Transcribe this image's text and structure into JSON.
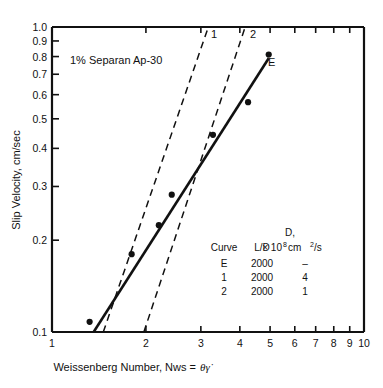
{
  "figure": {
    "background": "#ffffff",
    "ink": "#111111",
    "annotation": "1% Separan Ap-30"
  },
  "chart_data": {
    "type": "scatter",
    "title": "1% Separan Ap-30",
    "xlabel": "Weissenberg Number, Nws = θγ̇",
    "xlabel_plain": "Weissenberg Number, Nws =",
    "xlabel_symbol": "θγ̇",
    "ylabel": "Slip Velocity, cm/sec",
    "xscale": "log",
    "yscale": "log",
    "xlim": [
      1,
      10
    ],
    "ylim": [
      0.1,
      1.0
    ],
    "grid": false,
    "xticks": [
      1,
      2,
      3,
      4,
      5,
      6,
      7,
      8,
      9,
      10
    ],
    "xtick_labels": [
      "1",
      "2",
      "3",
      "4",
      "5",
      "6",
      "7",
      "8",
      "9",
      "10"
    ],
    "yticks": [
      0.1,
      0.2,
      0.3,
      0.4,
      0.5,
      0.6,
      0.7,
      0.8,
      0.9,
      1.0
    ],
    "ytick_labels": [
      "0.1",
      "0.2",
      "0.3",
      "0.4",
      "0.5",
      "0.6",
      "0.7",
      "0.8",
      "0.9",
      "1.0"
    ],
    "series": [
      {
        "name": "E",
        "label": "E",
        "style": "solid",
        "marker": "filled-circle",
        "points": [
          {
            "x": 1.32,
            "y": 0.108
          },
          {
            "x": 1.8,
            "y": 0.18
          },
          {
            "x": 2.2,
            "y": 0.224
          },
          {
            "x": 2.42,
            "y": 0.282
          },
          {
            "x": 3.28,
            "y": 0.443
          },
          {
            "x": 4.25,
            "y": 0.567
          },
          {
            "x": 4.95,
            "y": 0.812
          }
        ],
        "fit_line": [
          {
            "x": 1.36,
            "y": 0.1
          },
          {
            "x": 4.95,
            "y": 0.79
          }
        ]
      },
      {
        "name": "1",
        "label": "1",
        "style": "dashed",
        "line": [
          {
            "x": 1.46,
            "y": 0.1
          },
          {
            "x": 3.17,
            "y": 1.0
          }
        ]
      },
      {
        "name": "2",
        "label": "2",
        "style": "dashed",
        "line": [
          {
            "x": 1.97,
            "y": 0.1
          },
          {
            "x": 4.16,
            "y": 1.0
          }
        ]
      }
    ],
    "annotations": [
      {
        "text": "1% Separan Ap-30",
        "x": 1.28,
        "y": 0.755
      },
      {
        "text": "E",
        "x": 5.35,
        "y": 0.745
      },
      {
        "text": "1",
        "x": 3.05,
        "y": 0.955
      },
      {
        "text": "2",
        "x": 4.0,
        "y": 0.955
      }
    ],
    "legend": {
      "position": "inside-lower-right",
      "headers": [
        "Curve",
        "L/D",
        "D,"
      ],
      "header_unit_prefix": "× 10",
      "header_unit_exp": "8",
      "header_unit_suffix": " cm",
      "header_unit_suffix_exp": "2",
      "header_unit_tail": "/s",
      "rows": [
        {
          "curve": "E",
          "ld": "2000",
          "d": "–"
        },
        {
          "curve": "1",
          "ld": "2000",
          "d": "4"
        },
        {
          "curve": "2",
          "ld": "2000",
          "d": "1"
        }
      ]
    }
  }
}
